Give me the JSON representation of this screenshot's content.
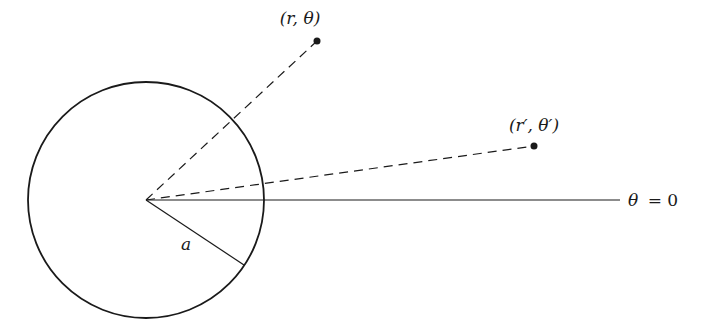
{
  "diagram": {
    "title": "",
    "colors": {
      "stroke": "#1a1a1a",
      "background": "#ffffff"
    },
    "circle": {
      "cx": 146,
      "cy": 200,
      "r": 118,
      "radius_label": "a"
    },
    "center": {
      "x": 146,
      "y": 200
    },
    "radius_line_end": {
      "x": 244,
      "y": 265
    },
    "axis": {
      "end_x": 620,
      "label_theta": "θ",
      "label_eq": "= 0"
    },
    "points": [
      {
        "name": "point-r-theta",
        "x": 317,
        "y": 41,
        "label": "(r, θ)",
        "label_x": 300,
        "label_y": 24
      },
      {
        "name": "point-r-prime-theta-prime",
        "x": 534,
        "y": 146,
        "label": "(r′, θ′)",
        "label_x": 534,
        "label_y": 131
      }
    ]
  }
}
